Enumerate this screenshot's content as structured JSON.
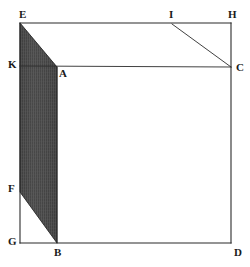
{
  "figure": {
    "canvas": {
      "width": 250,
      "height": 267
    },
    "colors": {
      "background": "#ffffff",
      "stroke": "#2b2b2b",
      "label": "#1a1a1a",
      "shading_dark": "#4a4a4a",
      "shading_light": "#6e6e6e"
    },
    "points": [
      {
        "id": "E",
        "label": "E",
        "x": 20,
        "y": 23,
        "label_x": 19,
        "label_y": 9
      },
      {
        "id": "I",
        "label": "I",
        "x": 172,
        "y": 23,
        "label_x": 169,
        "label_y": 9
      },
      {
        "id": "H",
        "label": "H",
        "x": 231,
        "y": 23,
        "label_x": 228,
        "label_y": 9
      },
      {
        "id": "K",
        "label": "K",
        "x": 20,
        "y": 66,
        "label_x": 8,
        "label_y": 59
      },
      {
        "id": "A",
        "label": "A",
        "x": 57,
        "y": 67,
        "label_x": 59,
        "label_y": 68
      },
      {
        "id": "C",
        "label": "C",
        "x": 231,
        "y": 67,
        "label_x": 236,
        "label_y": 62
      },
      {
        "id": "F",
        "label": "F",
        "x": 20,
        "y": 192,
        "label_x": 8,
        "label_y": 183
      },
      {
        "id": "G",
        "label": "G",
        "x": 20,
        "y": 243,
        "label_x": 8,
        "label_y": 236
      },
      {
        "id": "B",
        "label": "B",
        "x": 57,
        "y": 243,
        "label_x": 54,
        "label_y": 247
      },
      {
        "id": "D",
        "label": "D",
        "x": 231,
        "y": 243,
        "label_x": 234,
        "label_y": 247
      }
    ],
    "segments": [
      {
        "id": "EH",
        "from": "E",
        "to": "H",
        "note": "top edge of square"
      },
      {
        "id": "EG",
        "from": "E",
        "to": "G",
        "note": "left edge of square"
      },
      {
        "id": "GD",
        "from": "G",
        "to": "D",
        "note": "bottom edge of square"
      },
      {
        "id": "HD",
        "from": "H",
        "to": "D",
        "note": "right edge of square"
      },
      {
        "id": "KC",
        "from": "K",
        "to": "C",
        "note": "horizontal chord through A"
      },
      {
        "id": "AB",
        "from": "A",
        "to": "B",
        "note": "vertical edge of parallelogram"
      },
      {
        "id": "IC",
        "from": "I",
        "to": "C",
        "note": "diagonal from I to C"
      }
    ],
    "shaded_region": {
      "id": "EABF",
      "vertices": [
        "E",
        "A",
        "B",
        "F"
      ],
      "fill": "hatched-dark",
      "note": "shaded parallelogram E-A-B-F"
    }
  }
}
